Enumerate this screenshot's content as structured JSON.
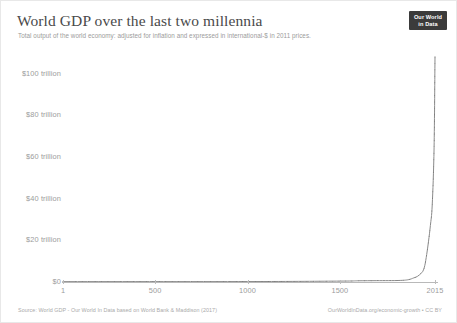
{
  "header": {
    "title": "World GDP over the last two millennia",
    "subtitle": "Total output of the world economy: adjusted for inflation and expressed in international-$ in 2011 prices.",
    "logo_line1": "Our World",
    "logo_line2": "in Data"
  },
  "footer": {
    "source": "Source: World GDP - Our World In Data based on World Bank & Maddison (2017)",
    "license": "OurWorldInData.org/economic-growth • CC BY"
  },
  "chart_data": {
    "type": "line",
    "title": "World GDP over the last two millennia",
    "subtitle": "Total output of the world economy: adjusted for inflation and expressed in international-$ in 2011 prices.",
    "xlabel": "",
    "ylabel": "",
    "xlim": [
      1,
      2015
    ],
    "ylim": [
      0,
      108
    ],
    "y_unit": "trillion international-$ (2011 prices)",
    "grid": false,
    "legend": "none",
    "line_color": "#8a8a8a",
    "x_tick_labels": [
      "1",
      "500",
      "1000",
      "1500",
      "2015"
    ],
    "x_ticks": [
      1,
      500,
      1000,
      1500,
      2015
    ],
    "y_tick_labels": [
      "$0",
      "$20 trillion",
      "$40 trillion",
      "$60 trillion",
      "$80 trillion",
      "$100 trillion"
    ],
    "y_ticks": [
      0,
      20,
      40,
      60,
      80,
      100
    ],
    "series": [
      {
        "name": "World GDP",
        "x": [
          1,
          1000,
          1500,
          1600,
          1700,
          1820,
          1870,
          1900,
          1920,
          1940,
          1950,
          1960,
          1970,
          1980,
          1990,
          2000,
          2010,
          2015
        ],
        "values": [
          0.18,
          0.21,
          0.43,
          0.58,
          0.64,
          0.73,
          1.1,
          1.97,
          2.7,
          4.2,
          5.3,
          8.0,
          13.2,
          19.6,
          27.1,
          37.0,
          64.5,
          108.0
        ]
      }
    ]
  }
}
